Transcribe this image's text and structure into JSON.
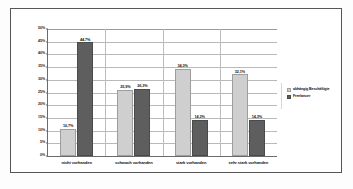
{
  "chart_data": {
    "type": "bar",
    "title": "",
    "subtitle": "",
    "xlabel": "",
    "ylabel": "",
    "ylim": [
      0,
      50
    ],
    "ytick_labels": [
      "50%",
      "45%",
      "40%",
      "35%",
      "30%",
      "25%",
      "20%",
      "15%",
      "10%",
      "5%",
      "0%"
    ],
    "ytick_values": [
      50,
      45,
      40,
      35,
      30,
      25,
      20,
      15,
      10,
      5,
      0
    ],
    "grid": true,
    "legend_position": "right",
    "categories": [
      "nicht vorhanden",
      "schwach vorhanden",
      "stark vorhanden",
      "sehr stark vorhanden"
    ],
    "series": [
      {
        "name": "abhängig Beschäftigte",
        "color": "#cfcfcf",
        "values": [
          10.7,
          25.9,
          34.3,
          32.1
        ],
        "labels": [
          "10,7%",
          "25,9%",
          "34,3%",
          "32,1%"
        ]
      },
      {
        "name": "Freelancer",
        "color": "#5e5e5e",
        "values": [
          44.7,
          26.3,
          14.3,
          14.3
        ],
        "labels": [
          "44,7%",
          "26,3%",
          "14,3%",
          "14,3%"
        ]
      }
    ]
  }
}
